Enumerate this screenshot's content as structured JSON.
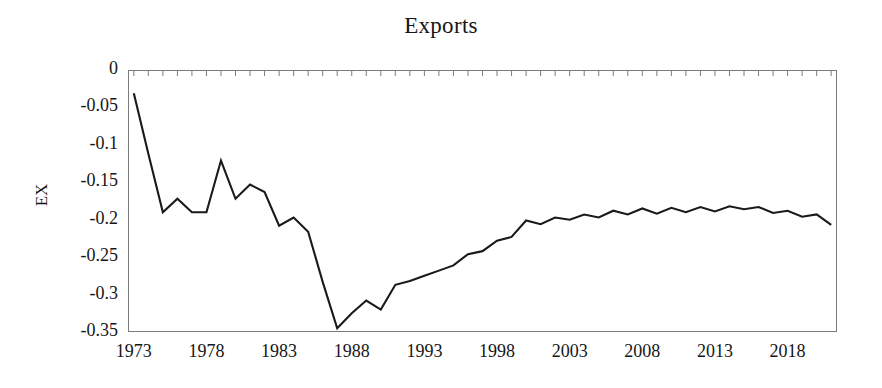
{
  "chart_data": {
    "type": "line",
    "title": "Exports",
    "xlabel": "",
    "ylabel": "EX",
    "xlim": [
      1972.6,
      2021.4
    ],
    "ylim": [
      -0.35,
      0
    ],
    "grid": false,
    "legend": "none",
    "axis_color": "#7b7b7b",
    "line_color": "#1a1a1a",
    "line_width": 2.1,
    "y_ticks": [
      0,
      -0.05,
      -0.1,
      -0.15,
      -0.2,
      -0.25,
      -0.3,
      -0.35
    ],
    "y_tick_labels": [
      "0",
      "-0.05",
      "-0.1",
      "-0.15",
      "-0.2",
      "-0.25",
      "-0.3",
      "-0.35"
    ],
    "x_ticks": [
      1973,
      1978,
      1983,
      1988,
      1993,
      1998,
      2003,
      2008,
      2013,
      2018
    ],
    "x_tick_labels": [
      "1973",
      "1978",
      "1983",
      "1988",
      "1993",
      "1998",
      "2003",
      "2008",
      "2013",
      "2018"
    ],
    "x_minor_tick_step": 1,
    "x_minor_ticks_position": "top",
    "series": [
      {
        "name": "EX",
        "x": [
          1973,
          1974,
          1975,
          1976,
          1977,
          1978,
          1979,
          1980,
          1981,
          1982,
          1983,
          1984,
          1985,
          1986,
          1987,
          1988,
          1989,
          1990,
          1991,
          1992,
          1993,
          1994,
          1995,
          1996,
          1997,
          1998,
          1999,
          2000,
          2001,
          2002,
          2003,
          2004,
          2005,
          2006,
          2007,
          2008,
          2009,
          2010,
          2011,
          2012,
          2013,
          2014,
          2015,
          2016,
          2017,
          2018,
          2019,
          2020,
          2021
        ],
        "values": [
          -0.031,
          -0.112,
          -0.19,
          -0.172,
          -0.19,
          -0.19,
          -0.121,
          -0.172,
          -0.153,
          -0.163,
          -0.208,
          -0.197,
          -0.216,
          -0.283,
          -0.345,
          -0.325,
          -0.308,
          -0.32,
          -0.287,
          -0.282,
          -0.275,
          -0.268,
          -0.261,
          -0.246,
          -0.242,
          -0.228,
          -0.223,
          -0.201,
          -0.206,
          -0.197,
          -0.2,
          -0.193,
          -0.197,
          -0.188,
          -0.193,
          -0.185,
          -0.192,
          -0.184,
          -0.19,
          -0.183,
          -0.189,
          -0.182,
          -0.186,
          -0.183,
          -0.191,
          -0.188,
          -0.196,
          -0.193,
          -0.207
        ]
      }
    ]
  }
}
